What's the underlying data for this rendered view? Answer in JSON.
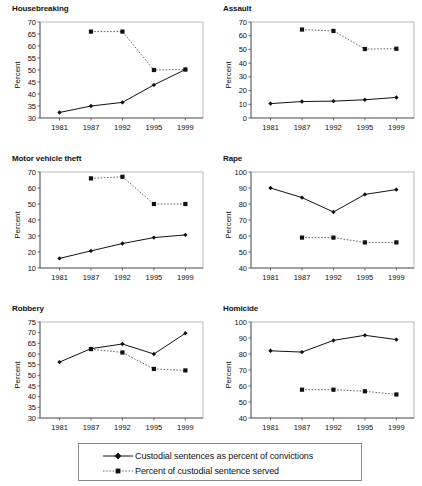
{
  "figure": {
    "ylabel": "Percent",
    "xticks": [
      "1981",
      "1987",
      "1992",
      "1995",
      "1999"
    ]
  },
  "legend": {
    "items": [
      {
        "label": "Custodial sentences as percent of convictions",
        "style": "solid-line-diamond-marker",
        "color": "#111111"
      },
      {
        "label": "Percent of custodial sentence served",
        "style": "dotted-line-square-marker",
        "color": "#555555"
      }
    ]
  },
  "chart_data": [
    {
      "type": "line",
      "title": "Housebreaking",
      "xlabel": "",
      "ylabel": "Percent",
      "x": [
        "1981",
        "1987",
        "1992",
        "1995",
        "1999"
      ],
      "ylim": [
        30,
        70
      ],
      "ytick_step": 5,
      "yticks": [
        30,
        35,
        40,
        45,
        50,
        55,
        60,
        65,
        70
      ],
      "grid": false,
      "legend_position": "below-figure",
      "series": [
        {
          "name": "Custodial sentences as percent of convictions",
          "values": [
            32.3,
            35.0,
            36.5,
            43.8,
            50.2
          ]
        },
        {
          "name": "Percent of custodial sentence served",
          "values": [
            null,
            66.0,
            66.0,
            50.0,
            50.2
          ]
        }
      ]
    },
    {
      "type": "line",
      "title": "Assault",
      "xlabel": "",
      "ylabel": "Percent",
      "x": [
        "1981",
        "1987",
        "1992",
        "1995",
        "1999"
      ],
      "ylim": [
        0,
        70
      ],
      "ytick_step": 10,
      "yticks": [
        0,
        10,
        20,
        30,
        40,
        50,
        60,
        70
      ],
      "grid": false,
      "legend_position": "below-figure",
      "series": [
        {
          "name": "Custodial sentences as percent of convictions",
          "values": [
            10.5,
            12.0,
            12.3,
            13.3,
            15.0
          ]
        },
        {
          "name": "Percent of custodial sentence served",
          "values": [
            null,
            64.5,
            63.5,
            50.3,
            50.5
          ]
        }
      ]
    },
    {
      "type": "line",
      "title": "Motor vehicle theft",
      "xlabel": "",
      "ylabel": "Percent",
      "x": [
        "1981",
        "1987",
        "1992",
        "1995",
        "1999"
      ],
      "ylim": [
        10,
        70
      ],
      "ytick_step": 10,
      "yticks": [
        10,
        20,
        30,
        40,
        50,
        60,
        70
      ],
      "grid": false,
      "legend_position": "below-figure",
      "series": [
        {
          "name": "Custodial sentences as percent of convictions",
          "values": [
            16.0,
            20.7,
            25.3,
            29.0,
            30.7
          ]
        },
        {
          "name": "Percent of custodial sentence served",
          "values": [
            null,
            66.0,
            67.0,
            50.0,
            50.0
          ]
        }
      ]
    },
    {
      "type": "line",
      "title": "Rape",
      "xlabel": "",
      "ylabel": "Percent",
      "x": [
        "1981",
        "1987",
        "1992",
        "1995",
        "1999"
      ],
      "ylim": [
        40,
        100
      ],
      "ytick_step": 10,
      "yticks": [
        40,
        50,
        60,
        70,
        80,
        90,
        100
      ],
      "grid": false,
      "legend_position": "below-figure",
      "series": [
        {
          "name": "Custodial sentences as percent of convictions",
          "values": [
            90.0,
            84.0,
            75.0,
            86.0,
            89.0
          ]
        },
        {
          "name": "Percent of custodial sentence served",
          "values": [
            null,
            59.0,
            59.0,
            56.0,
            56.0
          ]
        }
      ]
    },
    {
      "type": "line",
      "title": "Robbery",
      "xlabel": "",
      "ylabel": "Percent",
      "x": [
        "1981",
        "1987",
        "1992",
        "1995",
        "1999"
      ],
      "ylim": [
        30,
        75
      ],
      "ytick_step": 5,
      "yticks": [
        30,
        35,
        40,
        45,
        50,
        55,
        60,
        65,
        70,
        75
      ],
      "grid": false,
      "legend_position": "below-figure",
      "series": [
        {
          "name": "Custodial sentences as percent of convictions",
          "values": [
            56.2,
            62.5,
            64.7,
            60.0,
            69.7
          ]
        },
        {
          "name": "Percent of custodial sentence served",
          "values": [
            null,
            62.3,
            60.7,
            53.0,
            52.3
          ]
        }
      ]
    },
    {
      "type": "line",
      "title": "Homicide",
      "xlabel": "",
      "ylabel": "Percent",
      "x": [
        "1981",
        "1987",
        "1992",
        "1995",
        "1999"
      ],
      "ylim": [
        40,
        100
      ],
      "ytick_step": 10,
      "yticks": [
        40,
        50,
        60,
        70,
        80,
        90,
        100
      ],
      "grid": false,
      "legend_position": "below-figure",
      "series": [
        {
          "name": "Custodial sentences as percent of convictions",
          "values": [
            82.0,
            81.2,
            88.5,
            91.7,
            89.0
          ]
        },
        {
          "name": "Percent of custodial sentence served",
          "values": [
            null,
            57.7,
            57.7,
            56.7,
            54.7
          ]
        }
      ]
    }
  ]
}
